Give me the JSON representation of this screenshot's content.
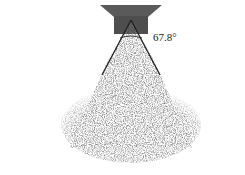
{
  "figure": {
    "angle_label": "67.8°",
    "caption": "",
    "colors": {
      "nozzle": "#5a5a5a",
      "nozzle_tip": "#3a3a3a",
      "cone_edge": "#222222",
      "droplets": "#555555",
      "background": "#ffffff"
    }
  }
}
